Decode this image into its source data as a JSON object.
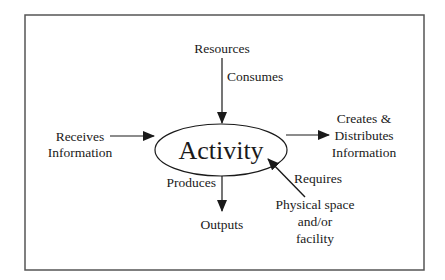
{
  "diagram": {
    "center": {
      "label": "Activity"
    },
    "nodes": {
      "resources": {
        "lines": [
          "Resources"
        ]
      },
      "receives": {
        "lines": [
          "Receives",
          "Information"
        ]
      },
      "creates": {
        "lines": [
          "Creates &",
          "Distributes",
          "Information"
        ]
      },
      "outputs": {
        "lines": [
          "Outputs"
        ]
      },
      "physical": {
        "lines": [
          "Physical space",
          "and/or",
          "facility"
        ]
      }
    },
    "edges": {
      "consumes": {
        "label": "Consumes",
        "from": "resources",
        "to": "activity"
      },
      "produces": {
        "label": "Produces",
        "from": "activity",
        "to": "outputs"
      },
      "requires": {
        "label": "Requires",
        "from": "physical",
        "to": "activity"
      },
      "receives": {
        "label": "",
        "from": "receives",
        "to": "activity"
      },
      "creates": {
        "label": "",
        "from": "activity",
        "to": "creates"
      }
    },
    "colors": {
      "stroke": "#1a1a1a",
      "border": "#555555",
      "background": "#ffffff"
    }
  }
}
